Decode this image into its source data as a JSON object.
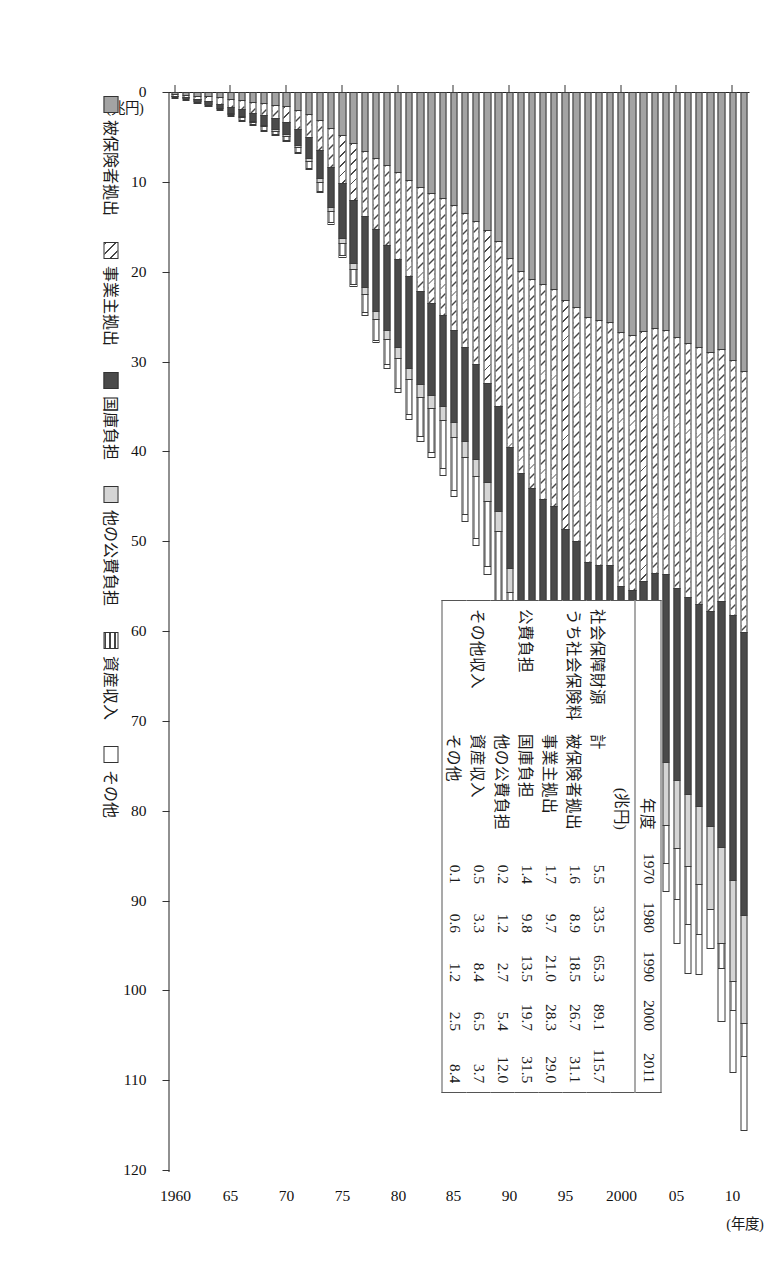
{
  "axes": {
    "y_unit": "(兆円)",
    "y_ticks": [
      "0",
      "10",
      "20",
      "30",
      "40",
      "50",
      "60",
      "70",
      "80",
      "90",
      "100",
      "110",
      "120"
    ],
    "x_unit": "(年度)",
    "x_ticks": [
      "1960",
      "65",
      "70",
      "75",
      "80",
      "85",
      "90",
      "95",
      "2000",
      "05",
      "10"
    ]
  },
  "legend": {
    "items": [
      {
        "label": "被保険者拠出",
        "swatch": "solid-grey",
        "color": "#a3a3a3"
      },
      {
        "label": "事業主拠出",
        "swatch": "diagonal-hatch",
        "color": "#ffffff"
      },
      {
        "label": "国庫負担",
        "swatch": "solid-dark",
        "color": "#4a4a4a"
      },
      {
        "label": "他の公費負担",
        "swatch": "light-grey",
        "color": "#d5d5d5"
      },
      {
        "label": "資産収入",
        "swatch": "horizontal-lines",
        "color": "#ffffff"
      },
      {
        "label": "その他",
        "swatch": "white",
        "color": "#ffffff"
      }
    ]
  },
  "table": {
    "corner_label": "年度",
    "unit_label": "(兆円)",
    "year_columns": [
      "1970",
      "1980",
      "1990",
      "2000",
      "2011"
    ],
    "rows": [
      {
        "group": "社会保障財源",
        "sub": "計",
        "values": [
          "5.5",
          "33.5",
          "65.3",
          "89.1",
          "115.7"
        ]
      },
      {
        "group": "うち社会保険料",
        "sub": "被保険者拠出",
        "values": [
          "1.6",
          "8.9",
          "18.5",
          "26.7",
          "31.1"
        ]
      },
      {
        "group": "",
        "sub": "事業主拠出",
        "values": [
          "1.7",
          "9.7",
          "21.0",
          "28.3",
          "29.0"
        ]
      },
      {
        "group": "公費負担",
        "sub": "国庫負担",
        "values": [
          "1.4",
          "9.8",
          "13.5",
          "19.7",
          "31.5"
        ]
      },
      {
        "group": "",
        "sub": "他の公費負担",
        "values": [
          "0.2",
          "1.2",
          "2.7",
          "5.4",
          "12.0"
        ]
      },
      {
        "group": "その他収入",
        "sub": "資産収入",
        "values": [
          "0.5",
          "3.3",
          "8.4",
          "6.5",
          "3.7"
        ]
      },
      {
        "group": "",
        "sub": "その他",
        "values": [
          "0.1",
          "0.6",
          "1.2",
          "2.5",
          "8.4"
        ]
      }
    ]
  },
  "chart_data": {
    "type": "bar",
    "title": "",
    "xlabel": "(年度)",
    "ylabel": "(兆円)",
    "ylim": [
      0,
      120
    ],
    "grid": false,
    "legend_position": "bottom-left",
    "stacked": true,
    "categories": [
      "1960",
      "1961",
      "1962",
      "1963",
      "1964",
      "1965",
      "1966",
      "1967",
      "1968",
      "1969",
      "1970",
      "1971",
      "1972",
      "1973",
      "1974",
      "1975",
      "1976",
      "1977",
      "1978",
      "1979",
      "1980",
      "1981",
      "1982",
      "1983",
      "1984",
      "1985",
      "1986",
      "1987",
      "1988",
      "1989",
      "1990",
      "1991",
      "1992",
      "1993",
      "1994",
      "1995",
      "1996",
      "1997",
      "1998",
      "1999",
      "2000",
      "2001",
      "2002",
      "2003",
      "2004",
      "2005",
      "2006",
      "2007",
      "2008",
      "2009",
      "2010",
      "2011"
    ],
    "series": [
      {
        "name": "被保険者拠出",
        "values": [
          0.2,
          0.3,
          0.4,
          0.5,
          0.6,
          0.8,
          0.9,
          1.1,
          1.2,
          1.4,
          1.6,
          2.0,
          2.4,
          3.1,
          4.0,
          4.8,
          5.7,
          6.6,
          7.3,
          8.1,
          8.9,
          9.8,
          10.6,
          11.2,
          11.8,
          12.6,
          13.5,
          14.4,
          15.4,
          16.6,
          18.5,
          19.9,
          20.8,
          21.4,
          21.9,
          23.2,
          23.9,
          25.1,
          25.4,
          25.6,
          26.7,
          27.0,
          26.6,
          26.3,
          26.5,
          27.3,
          27.9,
          28.4,
          28.9,
          28.6,
          29.8,
          31.1
        ]
      },
      {
        "name": "事業主拠出",
        "values": [
          0.2,
          0.3,
          0.4,
          0.5,
          0.7,
          0.9,
          1.0,
          1.2,
          1.4,
          1.5,
          1.7,
          2.1,
          2.6,
          3.4,
          4.4,
          5.3,
          6.3,
          7.2,
          8.0,
          8.9,
          9.7,
          10.7,
          11.6,
          12.3,
          13.0,
          13.9,
          14.9,
          15.9,
          17.0,
          18.4,
          21.0,
          22.5,
          23.3,
          23.9,
          24.2,
          25.4,
          26.1,
          27.2,
          27.2,
          27.0,
          28.3,
          28.4,
          27.8,
          27.2,
          27.2,
          27.9,
          28.3,
          28.6,
          28.9,
          28.1,
          28.4,
          29.0
        ]
      },
      {
        "name": "国庫負担",
        "values": [
          0.2,
          0.2,
          0.3,
          0.4,
          0.5,
          0.6,
          0.8,
          0.9,
          1.1,
          1.2,
          1.4,
          1.8,
          2.4,
          3.1,
          4.4,
          6.1,
          7.0,
          7.9,
          9.1,
          9.5,
          9.8,
          10.2,
          10.3,
          10.2,
          10.1,
          10.2,
          10.4,
          10.6,
          11.0,
          11.6,
          13.5,
          14.1,
          14.5,
          15.0,
          15.1,
          15.4,
          15.8,
          15.8,
          16.5,
          17.8,
          19.7,
          20.2,
          20.4,
          20.5,
          20.9,
          21.4,
          21.9,
          22.5,
          23.9,
          27.4,
          29.5,
          31.5
        ]
      },
      {
        "name": "他の公費負担",
        "values": [
          0.0,
          0.0,
          0.0,
          0.0,
          0.1,
          0.1,
          0.1,
          0.1,
          0.1,
          0.2,
          0.2,
          0.2,
          0.3,
          0.4,
          0.5,
          0.6,
          0.7,
          0.8,
          0.9,
          1.0,
          1.2,
          1.3,
          1.4,
          1.5,
          1.6,
          1.7,
          1.8,
          1.9,
          2.1,
          2.3,
          2.7,
          3.0,
          3.2,
          3.4,
          3.5,
          3.8,
          4.0,
          4.2,
          4.4,
          4.8,
          5.4,
          5.8,
          6.2,
          6.6,
          7.0,
          7.6,
          8.1,
          8.7,
          9.3,
          10.6,
          11.3,
          12.0
        ]
      },
      {
        "name": "資産収入",
        "values": [
          0.1,
          0.1,
          0.1,
          0.2,
          0.2,
          0.2,
          0.3,
          0.3,
          0.4,
          0.4,
          0.5,
          0.6,
          0.8,
          1.0,
          1.2,
          1.4,
          1.7,
          2.0,
          2.3,
          2.8,
          3.3,
          3.9,
          4.4,
          4.9,
          5.4,
          5.9,
          6.4,
          6.8,
          7.3,
          7.8,
          8.4,
          9.0,
          9.5,
          9.6,
          9.4,
          9.6,
          9.4,
          8.9,
          8.5,
          8.0,
          6.5,
          5.4,
          4.3,
          4.0,
          4.2,
          5.6,
          6.4,
          5.5,
          -4.5,
          2.8,
          3.2,
          3.7
        ]
      },
      {
        "name": "その他",
        "values": [
          0.0,
          0.0,
          0.0,
          0.0,
          0.0,
          0.1,
          0.1,
          0.1,
          0.1,
          0.1,
          0.1,
          0.1,
          0.2,
          0.2,
          0.3,
          0.3,
          0.3,
          0.4,
          0.4,
          0.5,
          0.6,
          0.6,
          0.7,
          0.7,
          0.8,
          0.8,
          0.9,
          0.9,
          1.0,
          1.1,
          1.2,
          1.3,
          1.4,
          1.5,
          1.6,
          1.7,
          1.8,
          1.9,
          2.0,
          2.2,
          2.5,
          2.7,
          2.9,
          3.1,
          3.3,
          5.1,
          5.6,
          4.6,
          4.4,
          6.0,
          7.0,
          8.4
        ]
      }
    ],
    "totals": [
      0.7,
      0.9,
      1.2,
      1.6,
      2.1,
      2.7,
      3.2,
      3.7,
      4.3,
      4.8,
      5.5,
      6.8,
      8.7,
      11.2,
      14.8,
      18.5,
      21.7,
      24.9,
      28.0,
      30.8,
      33.5,
      36.5,
      39.0,
      40.8,
      42.7,
      45.1,
      47.9,
      50.5,
      53.8,
      57.8,
      65.3,
      69.8,
      72.7,
      74.8,
      75.7,
      79.1,
      81.0,
      83.1,
      84.0,
      85.4,
      89.1,
      89.5,
      88.2,
      87.7,
      89.1,
      94.9,
      98.2,
      98.3,
      90.9,
      103.5,
      109.2,
      115.7
    ]
  }
}
